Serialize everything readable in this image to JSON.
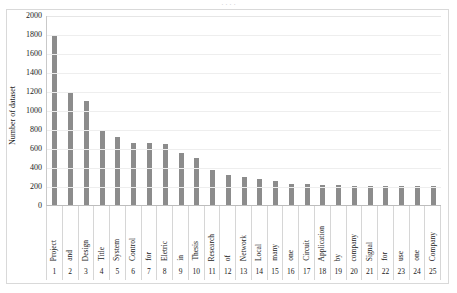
{
  "title_sliver": "· · · ·",
  "chart_data": {
    "type": "bar",
    "title": "",
    "xlabel": "",
    "ylabel": "Number of dataset",
    "ylim": [
      0,
      2000
    ],
    "ytick_step": 200,
    "yticks": [
      "2000",
      "1800",
      "1600",
      "1400",
      "1200",
      "1000",
      "800",
      "600",
      "400",
      "200",
      "0"
    ],
    "grid": true,
    "legend": "none",
    "bar_color": "#8c8c8c",
    "indices": [
      "1",
      "2",
      "3",
      "4",
      "5",
      "6",
      "7",
      "8",
      "9",
      "10",
      "11",
      "12",
      "13",
      "14",
      "15",
      "16",
      "17",
      "18",
      "19",
      "20",
      "21",
      "22",
      "23",
      "24",
      "25"
    ],
    "categories": [
      "Project",
      "and",
      "Design",
      "Title",
      "System",
      "Control",
      "for",
      "Eletric",
      "in",
      "Thesis",
      "Research",
      "of",
      "Network",
      "Local",
      "many",
      "one",
      "Circuit",
      "Application",
      "by",
      "company",
      "Signal",
      "for",
      "use",
      "one",
      "Company"
    ],
    "values": [
      1790,
      1190,
      1100,
      790,
      715,
      650,
      650,
      640,
      545,
      495,
      370,
      315,
      290,
      275,
      250,
      220,
      220,
      210,
      210,
      205,
      205,
      200,
      200,
      200,
      200
    ]
  }
}
